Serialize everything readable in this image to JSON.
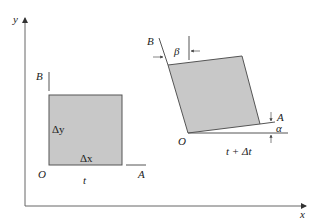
{
  "diagram": {
    "type": "shear-strain-deformation",
    "axes": {
      "x_label": "x",
      "y_label": "y"
    },
    "initial_element": {
      "origin_label": "O",
      "corner_a_label": "A",
      "corner_b_label": "B",
      "time_label": "t",
      "dx_label": "Δx",
      "dy_label": "Δy"
    },
    "deformed_element": {
      "origin_label": "O",
      "corner_a_label": "A",
      "corner_b_label": "B",
      "time_label": "t + Δt",
      "alpha_label": "α",
      "beta_label": "β"
    },
    "colors": {
      "fill": "#c8c8c8",
      "stroke": "#555555",
      "axis": "#666666"
    }
  }
}
